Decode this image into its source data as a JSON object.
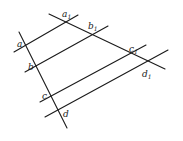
{
  "diagram": {
    "title": "",
    "stroke_color": "#1a1a1a",
    "background": "#ffffff",
    "lines": [
      {
        "id": "transversal-left",
        "x1": 19,
        "y1": 32,
        "x2": 67,
        "y2": 128
      },
      {
        "id": "transversal-right",
        "x1": 49,
        "y1": 14,
        "x2": 165,
        "y2": 69
      },
      {
        "id": "parallel-a",
        "x1": 14,
        "y1": 52,
        "x2": 78,
        "y2": 15
      },
      {
        "id": "parallel-b",
        "x1": 25,
        "y1": 72,
        "x2": 108,
        "y2": 26
      },
      {
        "id": "parallel-c",
        "x1": 40,
        "y1": 102,
        "x2": 146,
        "y2": 45
      },
      {
        "id": "parallel-d",
        "x1": 45,
        "y1": 117,
        "x2": 168,
        "y2": 50
      }
    ],
    "labels": {
      "a": {
        "text": "a",
        "sub": ""
      },
      "b": {
        "text": "b",
        "sub": ""
      },
      "c": {
        "text": "c",
        "sub": ""
      },
      "d": {
        "text": "d",
        "sub": ""
      },
      "a1": {
        "text": "a",
        "sub": "1"
      },
      "b1": {
        "text": "b",
        "sub": "1"
      },
      "c1": {
        "text": "c",
        "sub": "1"
      },
      "d1": {
        "text": "d",
        "sub": "1"
      }
    }
  }
}
